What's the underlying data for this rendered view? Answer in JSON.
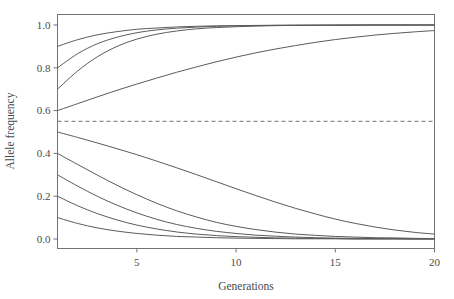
{
  "chart_data": {
    "type": "line",
    "title": "",
    "xlabel": "Generations",
    "ylabel": "Allele frequency",
    "xlim": [
      1,
      20
    ],
    "ylim": [
      0.0,
      1.0
    ],
    "xticks": [
      5,
      10,
      15,
      20
    ],
    "xtick_labels": [
      "5",
      "10",
      "15",
      "20"
    ],
    "yticks": [
      0.0,
      0.2,
      0.4,
      0.6,
      0.8,
      1.0
    ],
    "ytick_labels": [
      "0.0",
      "0.2",
      "0.4",
      "0.6",
      "0.8",
      "1.0"
    ],
    "grid": false,
    "legend": "none",
    "line_color": "#5b5b5b",
    "annotations": [
      {
        "name": "equilibrium-reference-line",
        "style": "dashed",
        "orientation": "horizontal",
        "y": 0.55,
        "color": "#6e6e6e"
      }
    ],
    "x": [
      1,
      2,
      3,
      4,
      5,
      6,
      7,
      8,
      9,
      10,
      11,
      12,
      13,
      14,
      15,
      16,
      17,
      18,
      19,
      20
    ],
    "series": [
      {
        "name": "p0 = 0.90 (increasing)",
        "start": 0.9,
        "end": 1.0,
        "values": [
          0.9,
          0.931,
          0.954,
          0.969,
          0.98,
          0.986,
          0.991,
          0.994,
          0.996,
          0.997,
          0.998,
          0.999,
          0.999,
          0.999,
          1.0,
          1.0,
          1.0,
          1.0,
          1.0,
          1.0
        ]
      },
      {
        "name": "p0 = 0.80 (increasing)",
        "start": 0.8,
        "end": 1.0,
        "values": [
          0.8,
          0.865,
          0.912,
          0.943,
          0.964,
          0.977,
          0.985,
          0.99,
          0.994,
          0.996,
          0.997,
          0.998,
          0.999,
          0.999,
          0.999,
          1.0,
          1.0,
          1.0,
          1.0,
          1.0
        ]
      },
      {
        "name": "p0 = 0.70 (increasing)",
        "start": 0.7,
        "end": 1.0,
        "values": [
          0.7,
          0.784,
          0.851,
          0.9,
          0.934,
          0.957,
          0.972,
          0.982,
          0.988,
          0.992,
          0.995,
          0.997,
          0.998,
          0.999,
          0.999,
          0.999,
          1.0,
          1.0,
          1.0,
          1.0
        ]
      },
      {
        "name": "p0 = 0.60 (increasing, slow)",
        "start": 0.6,
        "end": 1.0,
        "values": [
          0.6,
          0.632,
          0.664,
          0.695,
          0.724,
          0.752,
          0.779,
          0.804,
          0.828,
          0.85,
          0.87,
          0.888,
          0.904,
          0.919,
          0.932,
          0.943,
          0.953,
          0.961,
          0.968,
          0.974
        ]
      },
      {
        "name": "p0 = 0.50 (decreasing, slow)",
        "start": 0.5,
        "end": 0.0,
        "values": [
          0.5,
          0.475,
          0.449,
          0.422,
          0.394,
          0.364,
          0.333,
          0.301,
          0.268,
          0.235,
          0.203,
          0.172,
          0.143,
          0.117,
          0.093,
          0.073,
          0.056,
          0.042,
          0.031,
          0.023
        ]
      },
      {
        "name": "p0 = 0.40 (decreasing)",
        "start": 0.4,
        "end": 0.0,
        "values": [
          0.4,
          0.349,
          0.299,
          0.251,
          0.207,
          0.167,
          0.132,
          0.103,
          0.078,
          0.059,
          0.044,
          0.032,
          0.023,
          0.017,
          0.012,
          0.009,
          0.006,
          0.005,
          0.003,
          0.002
        ]
      },
      {
        "name": "p0 = 0.30 (decreasing)",
        "start": 0.3,
        "end": 0.0,
        "values": [
          0.3,
          0.248,
          0.2,
          0.158,
          0.122,
          0.092,
          0.068,
          0.05,
          0.036,
          0.026,
          0.018,
          0.013,
          0.009,
          0.006,
          0.004,
          0.003,
          0.002,
          0.002,
          0.001,
          0.001
        ]
      },
      {
        "name": "p0 = 0.20 (decreasing)",
        "start": 0.2,
        "end": 0.0,
        "values": [
          0.2,
          0.156,
          0.119,
          0.089,
          0.065,
          0.047,
          0.033,
          0.023,
          0.016,
          0.011,
          0.008,
          0.005,
          0.004,
          0.003,
          0.002,
          0.001,
          0.001,
          0.001,
          0.0,
          0.0
        ]
      },
      {
        "name": "p0 = 0.10 (decreasing, fast)",
        "start": 0.1,
        "end": 0.0,
        "values": [
          0.1,
          0.073,
          0.052,
          0.037,
          0.026,
          0.018,
          0.012,
          0.009,
          0.006,
          0.004,
          0.003,
          0.002,
          0.001,
          0.001,
          0.001,
          0.0,
          0.0,
          0.0,
          0.0,
          0.0
        ]
      }
    ]
  },
  "figure": {
    "background": "#ffffff",
    "axis_color": "#737373"
  }
}
